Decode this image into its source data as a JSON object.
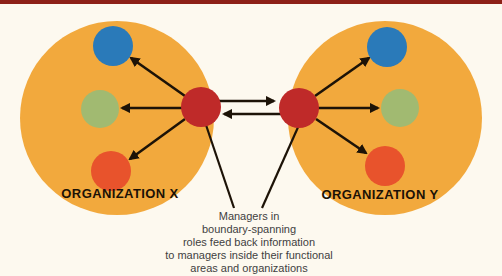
{
  "figure": {
    "background": "#fdf9ef",
    "top_rule_color": "#8d2017"
  },
  "organizations": [
    {
      "id": "x",
      "label": "ORGANIZATION X"
    },
    {
      "id": "y",
      "label": "ORGANIZATION Y"
    }
  ],
  "caption": {
    "text": "Managers in\nboundary-spanning\nroles feed back information\nto managers inside their functional\nareas and organizations"
  },
  "colors": {
    "organization_fill": "#f2a93d",
    "unit_top": "#2a7ab9",
    "unit_middle": "#a1ba71",
    "unit_bottom": "#e8532c",
    "boundary_spanner": "#bf2a29",
    "arrow": "#1d1307",
    "org_label_text": "#1b1206",
    "caption_text": "#3f3f3f"
  }
}
